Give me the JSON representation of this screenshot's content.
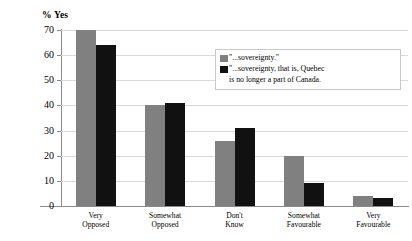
{
  "chart_data": {
    "type": "bar",
    "title": "",
    "ylabel": "% Yes",
    "xlabel": "",
    "categories": [
      "Very Opposed",
      "Somewhat Opposed",
      "Don't Know",
      "Somewhat Favourable",
      "Very Favourable"
    ],
    "category_lines": [
      [
        "Very",
        "Opposed"
      ],
      [
        "Somewhat",
        "Opposed"
      ],
      [
        "Don't",
        "Know"
      ],
      [
        "Somewhat",
        "Favourable"
      ],
      [
        "Very",
        "Favourable"
      ]
    ],
    "series": [
      {
        "name": "\"...sovereignty.\"",
        "color": "#808080",
        "values": [
          70,
          40,
          26,
          20,
          4
        ]
      },
      {
        "name": "\"...sovereignty, that is, Quebec is no longer a part of Canada.",
        "color": "#111111",
        "values": [
          64,
          41,
          31,
          9,
          3
        ]
      }
    ],
    "ylim": [
      0,
      70
    ],
    "yticks": [
      0,
      10,
      20,
      30,
      40,
      50,
      60,
      70
    ],
    "ytick_labels": [
      "0",
      "10",
      "20",
      "30",
      "40",
      "50",
      "60",
      "70"
    ],
    "grid": true,
    "legend_position": "upper-right-inside"
  },
  "legend": {
    "entries": [
      {
        "swatch": "gray-swatch",
        "label": "\"...sovereignty.\""
      },
      {
        "swatch": "black-swatch",
        "label": "\"...sovereignty, that is, Quebec\nis no longer a part of Canada."
      }
    ]
  }
}
